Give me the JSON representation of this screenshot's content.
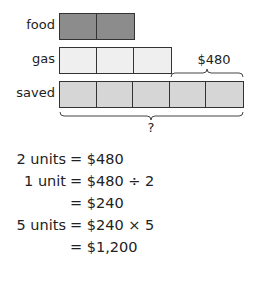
{
  "bar_model": {
    "rows": [
      {
        "label": "food",
        "units": 2,
        "color": "#8c8c8c"
      },
      {
        "label": "gas",
        "units": 3,
        "color": "#efefef"
      },
      {
        "label": "saved",
        "units": 5,
        "color": "#d6d6d6"
      }
    ],
    "top_brace_label": "$480",
    "bottom_brace_label": "?"
  },
  "work": [
    {
      "lhs": "2 units",
      "rhs": "= $480"
    },
    {
      "lhs": "1 unit",
      "rhs": "= $480 ÷ 2"
    },
    {
      "lhs": "",
      "rhs": "= $240"
    },
    {
      "lhs": "5 units",
      "rhs": "= $240 × 5"
    },
    {
      "lhs": "",
      "rhs": "= $1,200"
    }
  ]
}
